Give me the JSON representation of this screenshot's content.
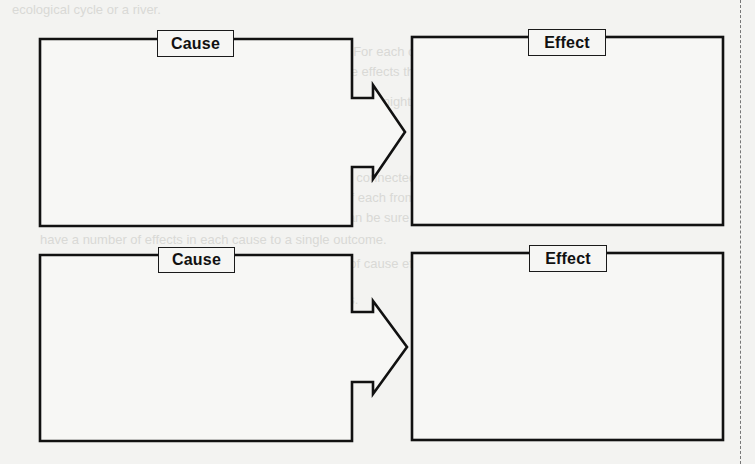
{
  "worksheet": {
    "title": "Cause and Effect Graphic Organizer",
    "rows": [
      {
        "cause": {
          "label": "Cause",
          "content": ""
        },
        "effect": {
          "label": "Effect",
          "content": ""
        }
      },
      {
        "cause": {
          "label": "Cause",
          "content": ""
        },
        "effect": {
          "label": "Effect",
          "content": ""
        }
      }
    ],
    "connector_icon": "right-arrow-icon",
    "colors": {
      "background": "#f3f3f1",
      "stroke": "#111111",
      "label_text": "#111111",
      "cut_line": "#777777"
    }
  },
  "bleed_through_text": [
    "ecological cycle or a river.",
    "For one cause, there are probably multiple effects. For each cause, notice",
    "how sometimes it is the things that are invisible and the effects that",
    "Tip: For a cause, underline the effects and what effects might they be",
    "with about the uncovered three times.",
    "Were they part of a cause, tell what effect about its two.",
    "Considering or thinking, the causes and effects can be connected in",
    "which each other may have an effect on the position of each from the",
    "happening of a different cause and effect. The cycle can be sure to",
    "have a number of effects in each cause to a single outcome.",
    "Effect of one or many, the paths sequence as one of cause effect",
    "Compare the Causes and Effects in each of the stories."
  ]
}
